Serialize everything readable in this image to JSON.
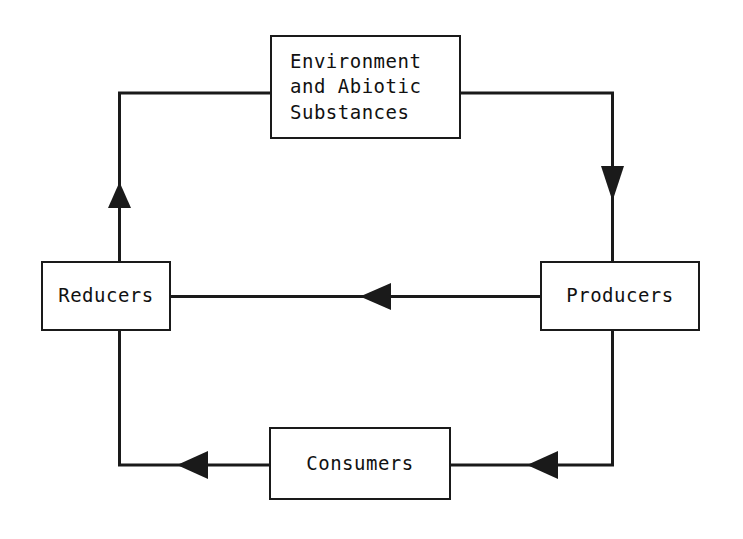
{
  "diagram": {
    "type": "cycle-flow-diagram",
    "background_color": "#ffffff",
    "line_color": "#1a1a1a",
    "text_color": "#111111",
    "nodes": [
      {
        "id": "environment",
        "label": "Environment\nand Abiotic\nSubstances",
        "line1": "Environment",
        "line2": "and Abiotic",
        "line3": "Substances"
      },
      {
        "id": "reducers",
        "label": "Reducers"
      },
      {
        "id": "producers",
        "label": "Producers"
      },
      {
        "id": "consumers",
        "label": "Consumers"
      }
    ],
    "edges": [
      {
        "id": "environment-to-producers",
        "from": "environment",
        "to": "producers",
        "direction": "down"
      },
      {
        "id": "producers-to-reducers",
        "from": "producers",
        "to": "reducers",
        "direction": "left"
      },
      {
        "id": "producers-to-consumers",
        "from": "producers",
        "to": "consumers",
        "direction": "left"
      },
      {
        "id": "consumers-to-reducers",
        "from": "consumers",
        "to": "reducers",
        "direction": "left"
      },
      {
        "id": "reducers-to-environment",
        "from": "reducers",
        "to": "environment",
        "direction": "up"
      }
    ]
  }
}
